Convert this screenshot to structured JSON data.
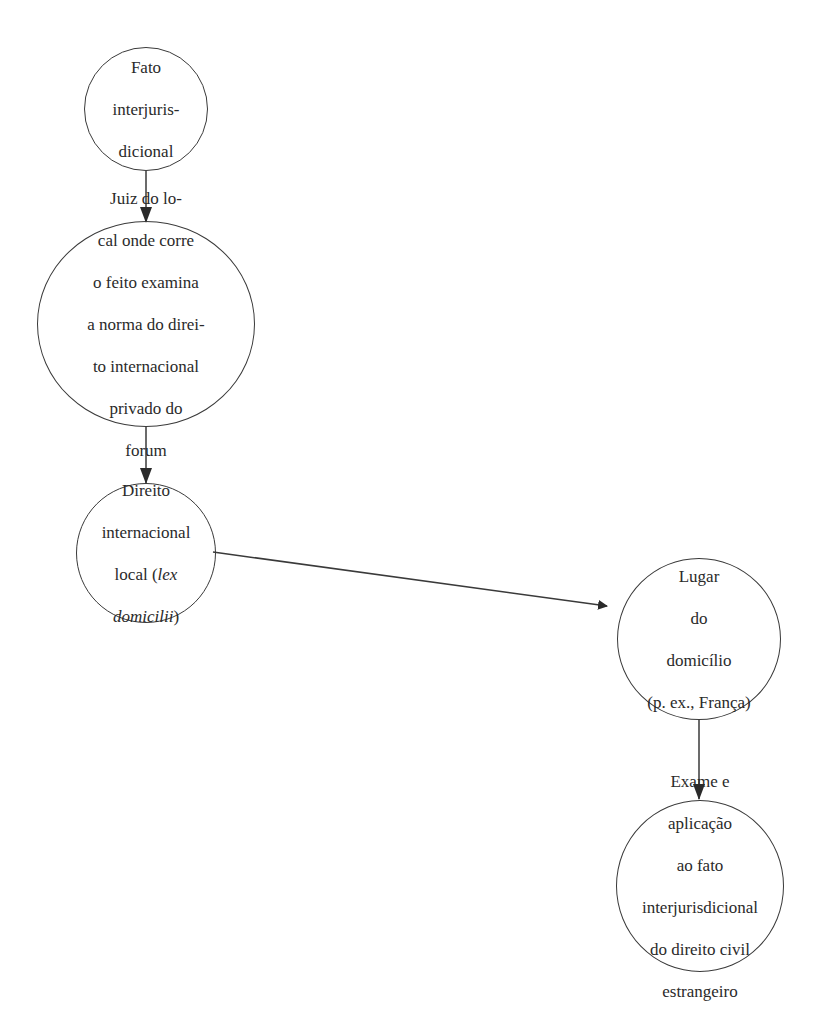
{
  "diagram": {
    "type": "flowchart",
    "nodes": [
      {
        "id": "n1",
        "lines": [
          "Fato",
          "interjuris-",
          "dicional"
        ]
      },
      {
        "id": "n2",
        "lines": [
          "Juiz do lo-",
          "cal onde corre",
          "o feito examina",
          "a norma do direi-",
          "to internacional",
          "privado do",
          "forum"
        ]
      },
      {
        "id": "n3",
        "lines": [
          "Direito",
          "internacional",
          "local (",
          "lex",
          "domicilii",
          ")"
        ],
        "text_plain": "Direito internacional local (lex domicilii)",
        "line1": "Direito",
        "line2": "internacional",
        "line3_pre": "local (",
        "line3_italic": "lex",
        "line4_italic": "domicilii",
        "line4_post": ")"
      },
      {
        "id": "n4",
        "lines": [
          "Lugar",
          "do",
          "domicílio",
          "(p. ex., França)"
        ]
      },
      {
        "id": "n5",
        "lines": [
          "Exame e",
          "aplicação",
          "ao fato",
          "interjurisdicional",
          "do direito civil",
          "estrangeiro"
        ]
      }
    ],
    "edges": [
      {
        "from": "n1",
        "to": "n2"
      },
      {
        "from": "n2",
        "to": "n3"
      },
      {
        "from": "n3",
        "to": "n4"
      },
      {
        "from": "n4",
        "to": "n5"
      }
    ],
    "colors": {
      "stroke": "#3a3a3a",
      "background": "#ffffff"
    }
  }
}
